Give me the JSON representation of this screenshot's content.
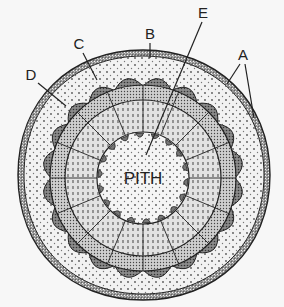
{
  "diagram": {
    "center_label": "PITH",
    "labels": [
      {
        "id": "A",
        "text": "A",
        "x": 243,
        "y": 60
      },
      {
        "id": "B",
        "text": "B",
        "x": 150,
        "y": 39
      },
      {
        "id": "C",
        "text": "C",
        "x": 79,
        "y": 49
      },
      {
        "id": "D",
        "text": "D",
        "x": 31,
        "y": 80
      },
      {
        "id": "E",
        "text": "E",
        "x": 203,
        "y": 18
      }
    ],
    "colors": {
      "background": "#f7f7f7",
      "line": "#222222",
      "stipple": "#555555",
      "dark_cap": "#6a6a6a"
    }
  }
}
